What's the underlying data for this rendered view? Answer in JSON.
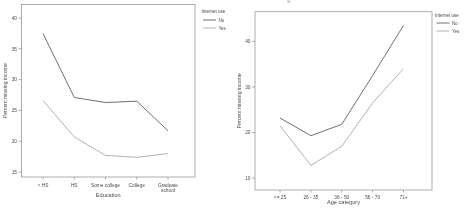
{
  "page": {
    "background": "#ffffff",
    "top_edge_artifact": "g"
  },
  "colors": {
    "frame": "#9a9a9a",
    "tick": "#8a8a8a",
    "text": "#4a4a4a",
    "series_no": "#606060",
    "series_yes": "#a8a8a8"
  },
  "legend": {
    "title": "Internet use",
    "items": [
      "No",
      "Yes"
    ]
  },
  "chart_data": [
    {
      "type": "line",
      "title": "",
      "xlabel": "Education",
      "ylabel": "Percent missing income",
      "categories": [
        "< HS",
        "HS",
        "Some college",
        "College",
        "Graduate\nschool"
      ],
      "series": [
        {
          "name": "No",
          "color": "#606060",
          "values": [
            37.5,
            27.1,
            26.3,
            26.5,
            21.7
          ]
        },
        {
          "name": "Yes",
          "color": "#a8a8a8",
          "values": [
            26.6,
            20.7,
            17.7,
            17.4,
            18.0
          ]
        }
      ],
      "yticks": [
        15,
        20,
        25,
        30,
        35,
        40
      ],
      "ylim": [
        14.2,
        42.2
      ],
      "grid": false,
      "legend_title": "Internet use",
      "legend_position": "right-top"
    },
    {
      "type": "line",
      "title": "",
      "xlabel": "Age category",
      "ylabel": "Percent missing income",
      "categories": [
        "<= 25",
        "26 - 35",
        "36 - 50",
        "56 - 70",
        "71+"
      ],
      "series": [
        {
          "name": "No",
          "color": "#606060",
          "values": [
            23.2,
            19.3,
            21.8,
            32.5,
            43.5
          ]
        },
        {
          "name": "Yes",
          "color": "#a8a8a8",
          "values": [
            21.5,
            12.8,
            17.0,
            26.5,
            34.0
          ]
        }
      ],
      "yticks": [
        10,
        20,
        30,
        40
      ],
      "ylim": [
        7.4,
        46.5
      ],
      "grid": false,
      "legend_title": "Internet use",
      "legend_position": "right-top"
    }
  ]
}
